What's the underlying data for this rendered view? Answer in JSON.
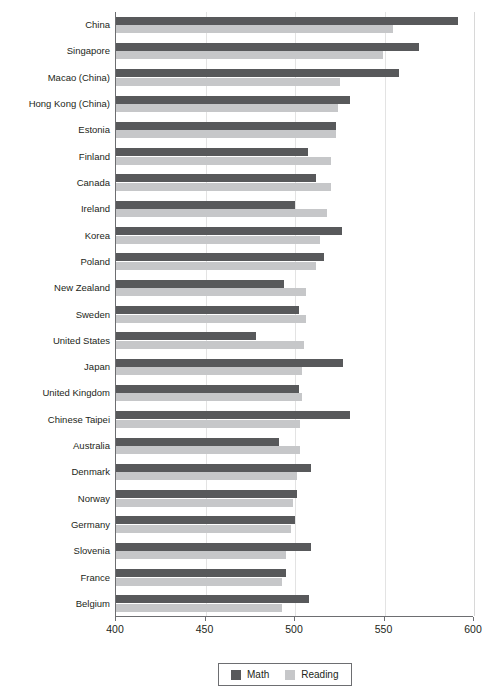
{
  "chart_data": {
    "type": "bar",
    "orientation": "horizontal",
    "title": "",
    "subtitle": "",
    "xlabel": "",
    "ylabel": "",
    "xlim": [
      400,
      600
    ],
    "xticks": [
      400,
      450,
      500,
      550,
      600
    ],
    "grid": true,
    "legend_position": "bottom",
    "categories": [
      "China",
      "Singapore",
      "Macao (China)",
      "Hong Kong (China)",
      "Estonia",
      "Finland",
      "Canada",
      "Ireland",
      "Korea",
      "Poland",
      "New Zealand",
      "Sweden",
      "United States",
      "Japan",
      "United Kingdom",
      "Chinese Taipei",
      "Australia",
      "Denmark",
      "Norway",
      "Germany",
      "Slovenia",
      "France",
      "Belgium"
    ],
    "series": [
      {
        "name": "Math",
        "color": "#58595b",
        "values": [
          591,
          569,
          558,
          531,
          523,
          507,
          512,
          500,
          526,
          516,
          494,
          502,
          478,
          527,
          502,
          531,
          491,
          509,
          501,
          500,
          509,
          495,
          508
        ]
      },
      {
        "name": "Reading",
        "color": "#c6c7c9",
        "values": [
          555,
          549,
          525,
          524,
          523,
          520,
          520,
          518,
          514,
          512,
          506,
          506,
          505,
          504,
          504,
          503,
          503,
          501,
          499,
          498,
          495,
          493,
          493
        ]
      }
    ]
  },
  "legend": {
    "entries": [
      {
        "label": "Math",
        "color": "#58595b",
        "swatch_name": "legend-swatch-math"
      },
      {
        "label": "Reading",
        "color": "#c6c7c9",
        "swatch_name": "legend-swatch-reading"
      }
    ]
  },
  "axis": {
    "x_tick_labels": [
      "400",
      "450",
      "500",
      "550",
      "600"
    ]
  }
}
